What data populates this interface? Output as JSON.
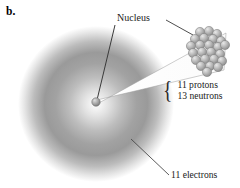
{
  "figure": {
    "panel_label": "b.",
    "background_color": "#ffffff"
  },
  "labels": {
    "nucleus": "Nucleus",
    "protons": "11 protons",
    "neutrons": "13 neutrons",
    "electrons": "11 electrons",
    "brace": "{"
  },
  "colors": {
    "cloud_dark": "#8d8d8d",
    "cloud_mid": "#a9a9a9",
    "nucleon_fill": "#b4b4b4",
    "nucleon_stroke": "#6f6f6f",
    "leader_line": "#3a3a3a",
    "cone_fill": "#ffffff",
    "text": "#1b1b1b"
  },
  "geometry": {
    "electron_cloud": {
      "cx": 96,
      "cy": 104,
      "r": 78
    },
    "nucleus_dot": {
      "cx": 96,
      "cy": 102,
      "r": 4.2
    },
    "nucleus_cluster": {
      "cx": 209,
      "cy": 50,
      "rx": 20,
      "ry": 21
    },
    "magnifier_cone": {
      "apex_x": 97,
      "apex_y": 102,
      "far_top_x": 226,
      "far_top_y": 35,
      "far_bottom_x": 224,
      "far_bottom_y": 68
    },
    "leader_nucleus_left": {
      "x1": 115,
      "y1": 24,
      "x2": 97,
      "y2": 100
    },
    "leader_nucleus_right": {
      "x1": 165,
      "y1": 20,
      "x2": 192,
      "y2": 36
    },
    "leader_electrons": {
      "x1": 168,
      "y1": 176,
      "x2": 131,
      "y2": 139
    }
  },
  "nucleons": {
    "count": 24,
    "radius": 4.6,
    "positions": [
      [
        200,
        32
      ],
      [
        209,
        31
      ],
      [
        217,
        34
      ],
      [
        195,
        39
      ],
      [
        204,
        38
      ],
      [
        213,
        39
      ],
      [
        221,
        41
      ],
      [
        191,
        46
      ],
      [
        200,
        45
      ],
      [
        209,
        45
      ],
      [
        218,
        47
      ],
      [
        225,
        45
      ],
      [
        193,
        53
      ],
      [
        202,
        52
      ],
      [
        211,
        52
      ],
      [
        220,
        54
      ],
      [
        196,
        60
      ],
      [
        205,
        59
      ],
      [
        214,
        59
      ],
      [
        222,
        61
      ],
      [
        201,
        66
      ],
      [
        210,
        66
      ],
      [
        218,
        67
      ],
      [
        207,
        72
      ]
    ]
  }
}
